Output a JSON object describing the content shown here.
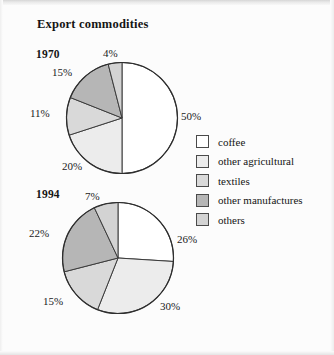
{
  "figure": {
    "title": "Export commodities"
  },
  "legend": {
    "items": [
      {
        "label": "coffee",
        "color": "#ffffff"
      },
      {
        "label": "other agricultural",
        "color": "#ececec"
      },
      {
        "label": "textiles",
        "color": "#d9d9d9"
      },
      {
        "label": "other manufactures",
        "color": "#b6b6b6"
      },
      {
        "label": "others",
        "color": "#d3d3d3"
      }
    ]
  },
  "panels": [
    {
      "year": "1970"
    },
    {
      "year": "1994"
    }
  ],
  "chart_data": [
    {
      "type": "pie",
      "title": "Export commodities",
      "subtitle": "1970",
      "categories": [
        "coffee",
        "other agricultural",
        "textiles",
        "other manufactures",
        "others"
      ],
      "values": [
        50,
        20,
        11,
        15,
        4
      ],
      "labels": [
        "50%",
        "20%",
        "11%",
        "15%",
        "4%"
      ],
      "colors": [
        "#ffffff",
        "#ececec",
        "#d9d9d9",
        "#b6b6b6",
        "#d3d3d3"
      ],
      "unit": "percent",
      "start_angle": 0,
      "direction": "clockwise",
      "legend_position": "right"
    },
    {
      "type": "pie",
      "title": "Export commodities",
      "subtitle": "1994",
      "categories": [
        "coffee",
        "other agricultural",
        "textiles",
        "other manufactures",
        "others"
      ],
      "values": [
        26,
        30,
        15,
        22,
        7
      ],
      "labels": [
        "26%",
        "30%",
        "15%",
        "22%",
        "7%"
      ],
      "colors": [
        "#ffffff",
        "#ececec",
        "#d9d9d9",
        "#b6b6b6",
        "#d3d3d3"
      ],
      "unit": "percent",
      "start_angle": 0,
      "direction": "clockwise",
      "legend_position": "right"
    }
  ]
}
